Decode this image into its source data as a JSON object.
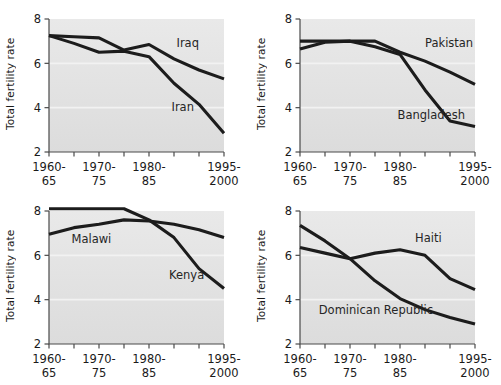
{
  "figure": {
    "axis_color": "#4a4a4a",
    "line_color": "#1c1c1c",
    "plot_bg_top": "#e9e9e9",
    "plot_bg_bottom": "#dcdcdc",
    "gridline_color": "#f2f2f2"
  },
  "chart_data": [
    {
      "type": "line",
      "title": "",
      "xlabel": "",
      "ylabel": "Total fertility rate",
      "ylim": [
        2,
        8
      ],
      "yticks": [
        2,
        4,
        6,
        8
      ],
      "ytick_labels": [
        "2",
        "4",
        "6",
        "8"
      ],
      "grid": true,
      "legend": "inline-annotations",
      "x": [
        "1960-65",
        "1965-70",
        "1970-75",
        "1975-80",
        "1980-85",
        "1985-90",
        "1990-95",
        "1995-2000"
      ],
      "xtick_labels": [
        {
          "index": 0,
          "line1": "1960-",
          "line2": "65"
        },
        {
          "index": 2,
          "line1": "1970-",
          "line2": "75"
        },
        {
          "index": 4,
          "line1": "1980-",
          "line2": "85"
        },
        {
          "index": 7,
          "line1": "1995-",
          "line2": "2000"
        }
      ],
      "series": [
        {
          "name": "Iraq",
          "values": [
            7.25,
            7.2,
            7.15,
            6.6,
            6.85,
            6.2,
            5.7,
            5.3
          ],
          "label_x_index": 5.1,
          "label_y": 6.75
        },
        {
          "name": "Iran",
          "values": [
            7.25,
            6.9,
            6.5,
            6.55,
            6.3,
            5.1,
            4.15,
            2.85
          ],
          "label_x_index": 4.9,
          "label_y": 3.85
        }
      ]
    },
    {
      "type": "line",
      "title": "",
      "xlabel": "",
      "ylabel": "Total fertility rate",
      "ylim": [
        2,
        8
      ],
      "yticks": [
        2,
        4,
        6,
        8
      ],
      "ytick_labels": [
        "2",
        "4",
        "6",
        "8"
      ],
      "grid": true,
      "legend": "inline-annotations",
      "x": [
        "1960-65",
        "1965-70",
        "1970-75",
        "1975-80",
        "1980-85",
        "1985-90",
        "1990-95",
        "1995-2000"
      ],
      "xtick_labels": [
        {
          "index": 0,
          "line1": "1960-",
          "line2": "65"
        },
        {
          "index": 2,
          "line1": "1970-",
          "line2": "75"
        },
        {
          "index": 4,
          "line1": "1980-",
          "line2": "85"
        },
        {
          "index": 7,
          "line1": "1995-",
          "line2": "2000"
        }
      ],
      "series": [
        {
          "name": "Pakistan",
          "values": [
            7.0,
            7.0,
            7.0,
            7.0,
            6.5,
            6.1,
            5.6,
            5.05
          ],
          "label_x_index": 5.0,
          "label_y": 6.75
        },
        {
          "name": "Bangladesh",
          "values": [
            6.65,
            6.95,
            7.0,
            6.75,
            6.4,
            4.8,
            3.4,
            3.15
          ],
          "label_x_index": 3.9,
          "label_y": 3.5
        }
      ]
    },
    {
      "type": "line",
      "title": "",
      "xlabel": "",
      "ylabel": "Total fertility rate",
      "ylim": [
        2,
        8
      ],
      "yticks": [
        2,
        4,
        6,
        8
      ],
      "ytick_labels": [
        "2",
        "4",
        "6",
        "8"
      ],
      "grid": true,
      "legend": "inline-annotations",
      "x": [
        "1960-65",
        "1965-70",
        "1970-75",
        "1975-80",
        "1980-85",
        "1985-90",
        "1990-95",
        "1995-2000"
      ],
      "xtick_labels": [
        {
          "index": 0,
          "line1": "1960-",
          "line2": "65"
        },
        {
          "index": 2,
          "line1": "1970-",
          "line2": "75"
        },
        {
          "index": 4,
          "line1": "1980-",
          "line2": "85"
        },
        {
          "index": 7,
          "line1": "1995-",
          "line2": "2000"
        }
      ],
      "series": [
        {
          "name": "Kenya",
          "values": [
            8.1,
            8.1,
            8.1,
            8.1,
            7.6,
            6.8,
            5.4,
            4.5
          ],
          "label_x_index": 4.8,
          "label_y": 4.95
        },
        {
          "name": "Malawi",
          "values": [
            6.95,
            7.25,
            7.4,
            7.6,
            7.55,
            7.4,
            7.15,
            6.8
          ],
          "label_x_index": 0.9,
          "label_y": 6.55
        }
      ]
    },
    {
      "type": "line",
      "title": "",
      "xlabel": "",
      "ylabel": "Total fertility rate",
      "ylim": [
        2,
        8
      ],
      "yticks": [
        2,
        4,
        6,
        8
      ],
      "ytick_labels": [
        "2",
        "4",
        "6",
        "8"
      ],
      "grid": true,
      "legend": "inline-annotations",
      "x": [
        "1960-65",
        "1965-70",
        "1970-75",
        "1975-80",
        "1980-85",
        "1985-90",
        "1990-95",
        "1995-2000"
      ],
      "xtick_labels": [
        {
          "index": 0,
          "line1": "1960-",
          "line2": "65"
        },
        {
          "index": 2,
          "line1": "1970-",
          "line2": "75"
        },
        {
          "index": 4,
          "line1": "1980-",
          "line2": "85"
        },
        {
          "index": 7,
          "line1": "1995-",
          "line2": "2000"
        }
      ],
      "series": [
        {
          "name": "Haiti",
          "values": [
            6.35,
            6.1,
            5.85,
            6.1,
            6.25,
            6.0,
            4.95,
            4.45
          ],
          "label_x_index": 4.6,
          "label_y": 6.6
        },
        {
          "name": "Dominican Republic",
          "values": [
            7.35,
            6.65,
            5.85,
            4.85,
            4.05,
            3.55,
            3.2,
            2.9
          ],
          "label_x_index": 0.75,
          "label_y": 3.35
        }
      ]
    }
  ]
}
